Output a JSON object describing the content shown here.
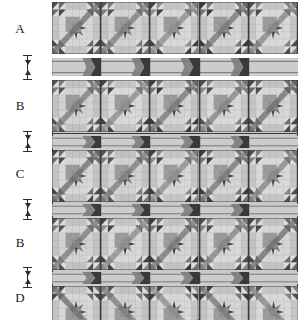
{
  "diagram": {
    "kind": "quilt-layout-diagram",
    "columns": 5,
    "canvas": {
      "width": 305,
      "height": 322
    }
  },
  "palette": {
    "background": "#ffffff",
    "outline": "#3b3b3b",
    "label_text": "#1c1c1c",
    "dimension_line": "#2b2b2b",
    "tone_lightest": "#dcdcdc",
    "tone_light": "#cccccc",
    "tone_mid_light": "#b4b4b4",
    "tone_mid": "#9a9a9a",
    "tone_mid_dark": "#7d7d7d",
    "tone_dark": "#5e5e5e",
    "tone_darkest": "#3f3f3f",
    "tone_near_black": "#2e2e2e"
  },
  "rows": [
    {
      "id": "row-a",
      "label": "A",
      "type": "block-row",
      "blocks": 5,
      "top": 2,
      "height": 52
    },
    {
      "id": "sash-1",
      "label": "",
      "type": "sashing-row",
      "blocks": 5,
      "top": 58,
      "height": 18
    },
    {
      "id": "row-b1",
      "label": "B",
      "type": "block-row",
      "blocks": 5,
      "top": 80,
      "height": 52
    },
    {
      "id": "sash-2",
      "label": "",
      "type": "sashing-row",
      "blocks": 5,
      "top": 136,
      "height": 12
    },
    {
      "id": "row-c",
      "label": "C",
      "type": "block-row",
      "blocks": 5,
      "top": 150,
      "height": 52
    },
    {
      "id": "sash-3",
      "label": "",
      "type": "sashing-row",
      "blocks": 5,
      "top": 204,
      "height": 12
    },
    {
      "id": "row-b2",
      "label": "B",
      "type": "block-row",
      "blocks": 5,
      "top": 218,
      "height": 52
    },
    {
      "id": "sash-4",
      "label": "",
      "type": "sashing-row",
      "blocks": 5,
      "top": 272,
      "height": 12
    },
    {
      "id": "row-d",
      "label": "D",
      "type": "block-row",
      "blocks": 5,
      "top": 286,
      "height": 34
    }
  ],
  "row_labels": [
    {
      "text": "A",
      "top": 22
    },
    {
      "text": "B",
      "top": 99
    },
    {
      "text": "C",
      "top": 167
    },
    {
      "text": "B",
      "top": 236
    },
    {
      "text": "D",
      "top": 291
    }
  ],
  "dimension_markers": [
    {
      "id": "dim-1",
      "top": 55,
      "height": 25,
      "arrows": "both"
    },
    {
      "id": "dim-2",
      "top": 131,
      "height": 21,
      "arrows": "both"
    },
    {
      "id": "dim-3",
      "top": 199,
      "height": 21,
      "arrows": "both"
    },
    {
      "id": "dim-4",
      "top": 267,
      "height": 21,
      "arrows": "both"
    }
  ],
  "block_variants": [
    {
      "name": "star-paw-dark-center",
      "center": "#8e8e8e",
      "petal": "#4a4a4a",
      "leaf": "#6d6d6d",
      "bg": "#d6d6d6"
    },
    {
      "name": "star-paw-black-center",
      "center": "#2e2e2e",
      "petal": "#555555",
      "leaf": "#7b7b7b",
      "bg": "#d2d2d2"
    },
    {
      "name": "star-paw-mid-center",
      "center": "#6b6b6b",
      "petal": "#414141",
      "leaf": "#8c8c8c",
      "bg": "#d8d8d8"
    },
    {
      "name": "star-paw-grey-center",
      "center": "#909090",
      "petal": "#3c3c3c",
      "leaf": "#767676",
      "bg": "#d4d4d4"
    },
    {
      "name": "star-paw-deep-center",
      "center": "#2b2b2b",
      "petal": "#4f4f4f",
      "leaf": "#848484",
      "bg": "#d9d9d9"
    }
  ],
  "sashing": {
    "strip_fill": "#d3d3d3",
    "connector_fill": "#3a3a3a",
    "connector_count": 4,
    "note": "horizontal sashing strip with dark square-on-point connectors"
  }
}
